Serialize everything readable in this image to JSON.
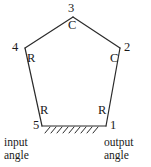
{
  "diagram": {
    "stroke_color": "#2b2b2b",
    "text_color": "#1a1a1a",
    "background": "#ffffff",
    "joints": [
      {
        "id": "1",
        "number": "1",
        "type": "R",
        "role": "output-ground-pivot"
      },
      {
        "id": "2",
        "number": "2",
        "type": "C",
        "role": "coupler-joint"
      },
      {
        "id": "3",
        "number": "3",
        "type": "C",
        "role": "coupler-joint"
      },
      {
        "id": "4",
        "number": "4",
        "type": "R",
        "role": "coupler-joint"
      },
      {
        "id": "5",
        "number": "5",
        "type": "R",
        "role": "input-ground-pivot"
      }
    ],
    "captions": {
      "input": "input\nangle",
      "output": "output\nangle"
    },
    "ground": {
      "name": "ground-hatching",
      "hatch_count": 9
    }
  }
}
